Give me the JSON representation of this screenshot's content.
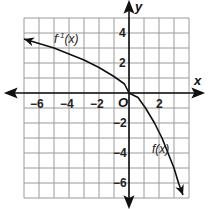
{
  "chart_data": {
    "type": "line",
    "title": "",
    "xlabel": "x",
    "ylabel": "y",
    "xlim": [
      -7,
      4
    ],
    "ylim": [
      -7,
      5
    ],
    "grid": true,
    "x_ticks": [
      -6,
      -4,
      -2,
      2
    ],
    "y_ticks": [
      4,
      2,
      -2,
      -4,
      -6
    ],
    "origin_label": "O",
    "series": [
      {
        "name": "f^-1(x)",
        "label": "f⁻¹(x)",
        "points": [
          [
            -7,
            3.6
          ],
          [
            -6,
            3.3
          ],
          [
            -5,
            3.0
          ],
          [
            -4,
            2.6
          ],
          [
            -3,
            2.2
          ],
          [
            -2,
            1.7
          ],
          [
            -1,
            1.1
          ],
          [
            -0.3,
            0.6
          ],
          [
            0,
            0
          ]
        ],
        "arrow": "left"
      },
      {
        "name": "f(x)",
        "label": "f(x)",
        "points": [
          [
            0,
            0
          ],
          [
            0.6,
            -0.3
          ],
          [
            1.1,
            -1
          ],
          [
            1.7,
            -2
          ],
          [
            2.2,
            -3
          ],
          [
            2.6,
            -4
          ],
          [
            3.0,
            -5
          ],
          [
            3.3,
            -6
          ],
          [
            3.6,
            -6.8
          ]
        ],
        "arrow": "down"
      }
    ]
  },
  "labels": {
    "x_axis": "x",
    "y_axis": "y",
    "origin": "O",
    "finv": "f",
    "finv_sup": "-1",
    "finv_arg": "(x)",
    "f": "f(x)",
    "xt": [
      "−6",
      "−4",
      "−2",
      "2"
    ],
    "yt": [
      "4",
      "2",
      "−2",
      "−4",
      "−6"
    ]
  }
}
